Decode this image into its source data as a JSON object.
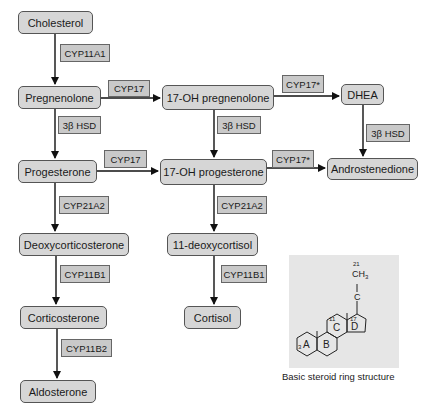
{
  "diagram": {
    "nodes": {
      "cholesterol": "Cholesterol",
      "pregnenolone": "Pregnenolone",
      "oh17_pregnenolone": "17-OH pregnenolone",
      "dhea": "DHEA",
      "progesterone": "Progesterone",
      "oh17_progesterone": "17-OH progesterone",
      "androstenedione": "Androstenedione",
      "deoxycorticosterone": "Deoxycorticosterone",
      "deoxycortisol11": "11-deoxycortisol",
      "corticosterone": "Corticosterone",
      "cortisol": "Cortisol",
      "aldosterone": "Aldosterone"
    },
    "enzymes": {
      "cyp11a1": "CYP11A1",
      "cyp17_top": "CYP17",
      "cyp17star_top": "CYP17*",
      "hsd_left": "3β HSD",
      "hsd_mid": "3β HSD",
      "hsd_right": "3β HSD",
      "cyp17_mid": "CYP17",
      "cyp17star_mid": "CYP17*",
      "cyp21a2_left": "CYP21A2",
      "cyp21a2_mid": "CYP21A2",
      "cyp11b1_left": "CYP11B1",
      "cyp11b1_right": "CYP11B1",
      "cyp11b2": "CYP11B2"
    },
    "edges": [
      [
        "Cholesterol",
        "Pregnenolone",
        "CYP11A1"
      ],
      [
        "Pregnenolone",
        "17-OH pregnenolone",
        "CYP17"
      ],
      [
        "17-OH pregnenolone",
        "DHEA",
        "CYP17*"
      ],
      [
        "Pregnenolone",
        "Progesterone",
        "3β HSD"
      ],
      [
        "17-OH pregnenolone",
        "17-OH progesterone",
        "3β HSD"
      ],
      [
        "DHEA",
        "Androstenedione",
        "3β HSD"
      ],
      [
        "Progesterone",
        "17-OH progesterone",
        "CYP17"
      ],
      [
        "17-OH progesterone",
        "Androstenedione",
        "CYP17*"
      ],
      [
        "Progesterone",
        "Deoxycorticosterone",
        "CYP21A2"
      ],
      [
        "17-OH progesterone",
        "11-deoxycortisol",
        "CYP21A2"
      ],
      [
        "Deoxycorticosterone",
        "Corticosterone",
        "CYP11B1"
      ],
      [
        "11-deoxycortisol",
        "Cortisol",
        "CYP11B1"
      ],
      [
        "Corticosterone",
        "Aldosterone",
        "CYP11B2"
      ]
    ]
  },
  "steroid_panel": {
    "rings": {
      "a": "A",
      "b": "B",
      "c": "C",
      "d": "D"
    },
    "labels": {
      "c21": "21",
      "ch3": "CH",
      "ch3_sub": "3",
      "c": "C",
      "c17": "17",
      "c11": "11",
      "c3": "3"
    },
    "caption": "Basic steroid ring structure"
  }
}
